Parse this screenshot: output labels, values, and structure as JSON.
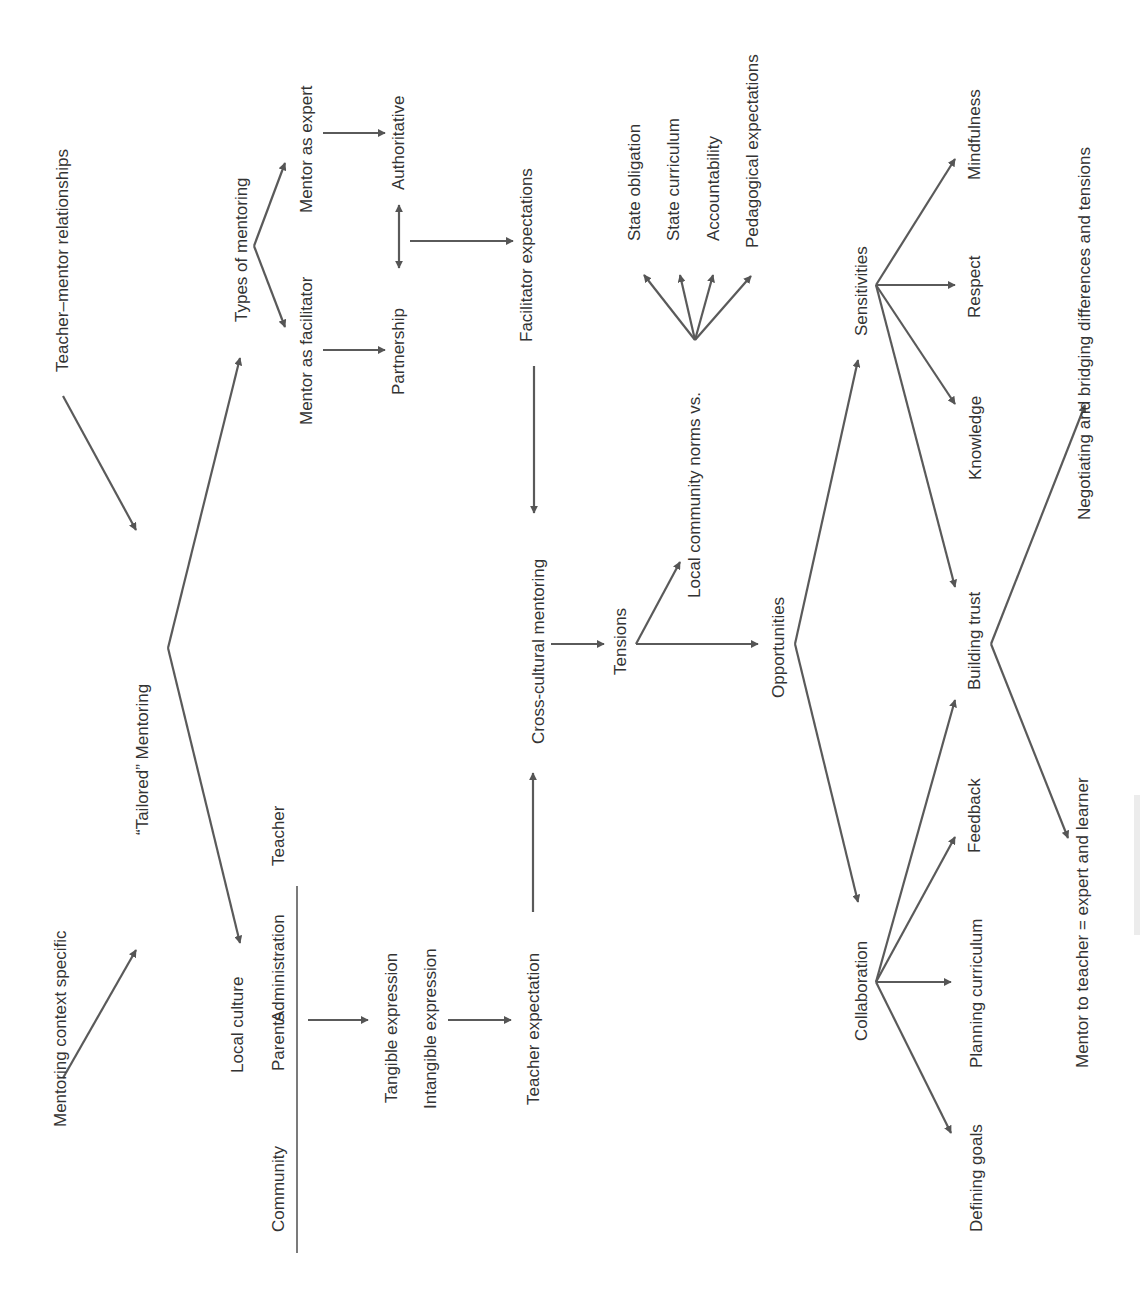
{
  "diagram": {
    "colors": {
      "line": "#5a5a5a",
      "text": "#333333",
      "background": "#ffffff"
    },
    "nodes": [
      {
        "id": "teacher-mentor-relationships",
        "label": "Teacher–mentor relationships"
      },
      {
        "id": "mentoring-context-specific",
        "label": "Mentoring context specific"
      },
      {
        "id": "tailored-mentoring",
        "label": "“Tailored” Mentoring"
      },
      {
        "id": "types-of-mentoring",
        "label": "Types of mentoring"
      },
      {
        "id": "mentor-as-facilitator",
        "label": "Mentor as facilitator"
      },
      {
        "id": "mentor-as-expert",
        "label": "Mentor as expert"
      },
      {
        "id": "partnership",
        "label": "Partnership"
      },
      {
        "id": "authoritative",
        "label": "Authoritative"
      },
      {
        "id": "facilitator-expectations",
        "label": "Facilitator expectations"
      },
      {
        "id": "local-culture",
        "label": "Local culture"
      },
      {
        "id": "community",
        "label": "Community"
      },
      {
        "id": "parents",
        "label": "Parents"
      },
      {
        "id": "administration",
        "label": "Administration"
      },
      {
        "id": "teacher",
        "label": "Teacher"
      },
      {
        "id": "tangible-expression",
        "label": "Tangible expression"
      },
      {
        "id": "intangible-expression",
        "label": "Intangible expression"
      },
      {
        "id": "teacher-expectation",
        "label": "Teacher expectation"
      },
      {
        "id": "cross-cultural-mentoring",
        "label": "Cross-cultural mentoring"
      },
      {
        "id": "tensions",
        "label": "Tensions"
      },
      {
        "id": "local-community-norms",
        "label": "Local community norms vs."
      },
      {
        "id": "state-obligation",
        "label": "State obligation"
      },
      {
        "id": "state-curriculum",
        "label": "State curriculum"
      },
      {
        "id": "accountability",
        "label": "Accountability"
      },
      {
        "id": "pedagogical-expectations",
        "label": "Pedagogical expectations"
      },
      {
        "id": "opportunities",
        "label": "Opportunities"
      },
      {
        "id": "sensitivities",
        "label": "Sensitivities"
      },
      {
        "id": "collaboration",
        "label": "Collaboration"
      },
      {
        "id": "mindfulness",
        "label": "Mindfulness"
      },
      {
        "id": "respect",
        "label": "Respect"
      },
      {
        "id": "knowledge",
        "label": "Knowledge"
      },
      {
        "id": "building-trust",
        "label": "Building trust"
      },
      {
        "id": "feedback",
        "label": "Feedback"
      },
      {
        "id": "planning-curriculum",
        "label": "Planning curriculum"
      },
      {
        "id": "defining-goals",
        "label": "Defining goals"
      },
      {
        "id": "negotiating-bridging",
        "label": "Negotiating and bridging differences and tensions"
      },
      {
        "id": "mentor-to-teacher",
        "label": "Mentor to teacher = expert and learner"
      }
    ],
    "edges": [
      {
        "from": "teacher-mentor-relationships",
        "to": "tailored-mentoring",
        "type": "arrow"
      },
      {
        "from": "mentoring-context-specific",
        "to": "tailored-mentoring",
        "type": "arrow"
      },
      {
        "from": "tailored-mentoring",
        "to": "types-of-mentoring",
        "type": "arrow"
      },
      {
        "from": "tailored-mentoring",
        "to": "local-culture",
        "type": "arrow"
      },
      {
        "from": "types-of-mentoring",
        "to": "mentor-as-expert",
        "type": "arrow"
      },
      {
        "from": "types-of-mentoring",
        "to": "mentor-as-facilitator",
        "type": "arrow"
      },
      {
        "from": "mentor-as-expert",
        "to": "authoritative",
        "type": "arrow"
      },
      {
        "from": "mentor-as-facilitator",
        "to": "partnership",
        "type": "arrow"
      },
      {
        "from": "partnership",
        "to": "authoritative",
        "type": "double-arrow"
      },
      {
        "from": "partnership",
        "to": "facilitator-expectations",
        "type": "arrow"
      },
      {
        "from": "facilitator-expectations",
        "to": "cross-cultural-mentoring",
        "type": "arrow"
      },
      {
        "from": "local-culture",
        "to": "tangible-expression",
        "type": "arrow"
      },
      {
        "from": "intangible-expression",
        "to": "teacher-expectation",
        "type": "arrow"
      },
      {
        "from": "teacher-expectation",
        "to": "cross-cultural-mentoring",
        "type": "arrow"
      },
      {
        "from": "cross-cultural-mentoring",
        "to": "tensions",
        "type": "arrow"
      },
      {
        "from": "tensions",
        "to": "local-community-norms",
        "type": "arrow"
      },
      {
        "from": "tensions",
        "to": "opportunities",
        "type": "arrow"
      },
      {
        "from": "local-community-norms",
        "to": "state-obligation",
        "type": "arrow"
      },
      {
        "from": "local-community-norms",
        "to": "state-curriculum",
        "type": "arrow"
      },
      {
        "from": "local-community-norms",
        "to": "accountability",
        "type": "arrow"
      },
      {
        "from": "local-community-norms",
        "to": "pedagogical-expectations",
        "type": "arrow"
      },
      {
        "from": "opportunities",
        "to": "sensitivities",
        "type": "arrow"
      },
      {
        "from": "opportunities",
        "to": "collaboration",
        "type": "arrow"
      },
      {
        "from": "sensitivities",
        "to": "mindfulness",
        "type": "arrow"
      },
      {
        "from": "sensitivities",
        "to": "respect",
        "type": "arrow"
      },
      {
        "from": "sensitivities",
        "to": "knowledge",
        "type": "arrow"
      },
      {
        "from": "sensitivities",
        "to": "building-trust",
        "type": "arrow"
      },
      {
        "from": "collaboration",
        "to": "building-trust",
        "type": "arrow"
      },
      {
        "from": "collaboration",
        "to": "feedback",
        "type": "arrow"
      },
      {
        "from": "collaboration",
        "to": "planning-curriculum",
        "type": "arrow"
      },
      {
        "from": "collaboration",
        "to": "defining-goals",
        "type": "arrow"
      },
      {
        "from": "building-trust",
        "to": "negotiating-bridging",
        "type": "arrow"
      },
      {
        "from": "building-trust",
        "to": "mentor-to-teacher",
        "type": "arrow"
      }
    ]
  }
}
